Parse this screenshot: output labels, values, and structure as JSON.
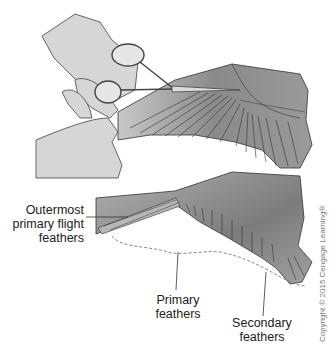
{
  "diagram": {
    "labels": {
      "outermost": [
        "Outermost",
        "primary flight",
        "feathers"
      ],
      "primary": [
        "Primary",
        "feathers"
      ],
      "secondary": [
        "Secondary",
        "feathers"
      ]
    },
    "copyright": "Copyright © 2015 Cengage Learning®",
    "colors": {
      "skin": "#d6d6d6",
      "wing_dark": "#7a7a7a",
      "wing_mid": "#9e9e9e",
      "outline": "#333333",
      "dashed": "#777777"
    }
  }
}
